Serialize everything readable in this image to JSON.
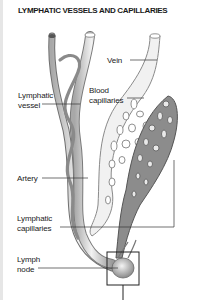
{
  "title": "LYMPHATIC VESSELS AND CAPILLARIES",
  "labels": {
    "vein": "Vein",
    "blood_capillaries": "Blood\ncapillaries",
    "lymphatic_vessel": "Lymphatic\nvessel",
    "artery": "Artery",
    "lymphatic_capillaries": "Lymphatic\ncapillaries",
    "lymph_node": "Lymph\nnode"
  },
  "colors": {
    "text": "#222222",
    "vessel_light": "#e4e4e4",
    "vessel_mid": "#bdbdbd",
    "lymphatic_dark": "#7a7a7a",
    "outline": "#555555"
  }
}
